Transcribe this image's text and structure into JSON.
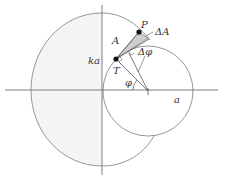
{
  "diagram": {
    "labels": {
      "P": "P",
      "T": "T",
      "A": "A",
      "delta_A": "ΔA",
      "ka": "ka",
      "delta_phi": "Δφ",
      "phi": "φ",
      "a": "a"
    },
    "colors": {
      "stroke": "#8a8a8a",
      "axis": "#707070",
      "shade_light": "#f4f4f4",
      "wedge": "#cfcfcf",
      "point": "#111111"
    }
  }
}
